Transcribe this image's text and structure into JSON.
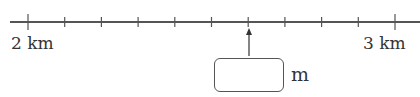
{
  "number_line": {
    "start_label": "2 km",
    "end_label": "3 km",
    "divisions": 10,
    "arrow_tick_index": 6
  },
  "answer": {
    "value": "",
    "unit": "m"
  }
}
